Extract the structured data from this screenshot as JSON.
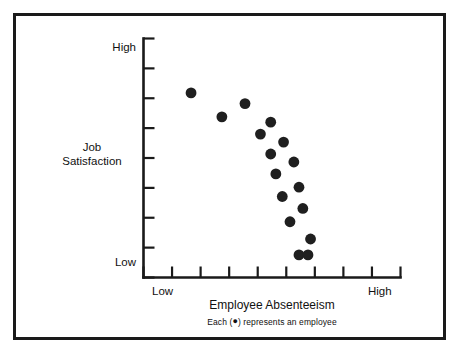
{
  "figure": {
    "background_color": "#ffffff",
    "frame_color": "#1a1a1a",
    "marker_color": "#1f1f1f"
  },
  "axes": {
    "y_title_line1": "Job",
    "y_title_line2": "Satisfaction",
    "y_high_label": "High",
    "y_low_label": "Low",
    "x_title": "Employee Absenteeism",
    "x_low_label": "Low",
    "x_high_label": "High"
  },
  "caption": {
    "prefix": "Each (",
    "marker_glyph": "●",
    "suffix": ") represents an employee",
    "full_text": "Each ( ● ) represents an employee"
  },
  "chart_data": {
    "type": "scatter",
    "title": "",
    "xlabel": "Employee Absenteeism",
    "ylabel": "Job Satisfaction",
    "xlim": [
      0,
      10
    ],
    "ylim": [
      0,
      9
    ],
    "grid": false,
    "legend": null,
    "x_tick_labels": [
      "Low",
      "",
      "",
      "",
      "",
      "",
      "",
      "",
      "",
      "High"
    ],
    "y_tick_labels": [
      "Low",
      "",
      "",
      "",
      "",
      "",
      "",
      "",
      "High"
    ],
    "x_tick_count": 10,
    "y_tick_count": 9,
    "marker": "circle",
    "marker_size_px": 5.4,
    "point_count": 16,
    "points": [
      {
        "x": 1.85,
        "y": 6.95
      },
      {
        "x": 3.05,
        "y": 6.05
      },
      {
        "x": 3.95,
        "y": 6.55
      },
      {
        "x": 4.55,
        "y": 5.4
      },
      {
        "x": 4.95,
        "y": 5.85
      },
      {
        "x": 4.95,
        "y": 4.65
      },
      {
        "x": 5.45,
        "y": 5.1
      },
      {
        "x": 5.15,
        "y": 3.9
      },
      {
        "x": 5.85,
        "y": 4.35
      },
      {
        "x": 5.4,
        "y": 3.05
      },
      {
        "x": 6.05,
        "y": 3.4
      },
      {
        "x": 6.2,
        "y": 2.6
      },
      {
        "x": 5.7,
        "y": 2.1
      },
      {
        "x": 6.5,
        "y": 1.45
      },
      {
        "x": 6.05,
        "y": 0.85
      },
      {
        "x": 6.4,
        "y": 0.85
      }
    ]
  }
}
